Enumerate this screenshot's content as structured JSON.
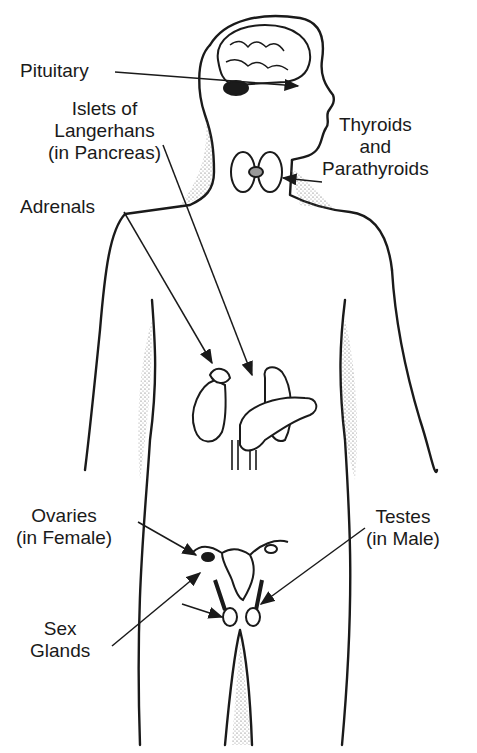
{
  "labels": {
    "pituitary": {
      "line1": "Pituitary"
    },
    "islets": {
      "line1": "Islets of",
      "line2": "Langerhans",
      "line3": "(in Pancreas)"
    },
    "thyroids": {
      "line1": "Thyroids",
      "line2": "and",
      "line3": "Parathyroids"
    },
    "adrenals": {
      "line1": "Adrenals"
    },
    "ovaries": {
      "line1": "Ovaries",
      "line2": "(in Female)"
    },
    "testes": {
      "line1": "Testes",
      "line2": "(in Male)"
    },
    "sex_glands": {
      "line1": "Sex",
      "line2": "Glands"
    }
  },
  "colors": {
    "ink": "#1a1a1a",
    "background": "#ffffff",
    "stipple": "#555555"
  }
}
